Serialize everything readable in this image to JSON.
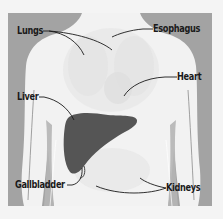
{
  "diagram": {
    "colors": {
      "background": "#f4f4f4",
      "backdrop": "#a3a3a3",
      "body": "#f2f2f2",
      "organ_ghost": "#e6e6e6",
      "liver": "#555555",
      "leader_line": "#1a1a1a",
      "label_text": "#1a1a1a"
    },
    "labels": [
      {
        "id": "lungs",
        "text": "Lungs"
      },
      {
        "id": "esophagus",
        "text": "Esophagus"
      },
      {
        "id": "heart",
        "text": "Heart"
      },
      {
        "id": "liver",
        "text": "Liver"
      },
      {
        "id": "gallbladder",
        "text": "Gallbladder"
      },
      {
        "id": "kidneys",
        "text": "Kidneys"
      }
    ]
  }
}
